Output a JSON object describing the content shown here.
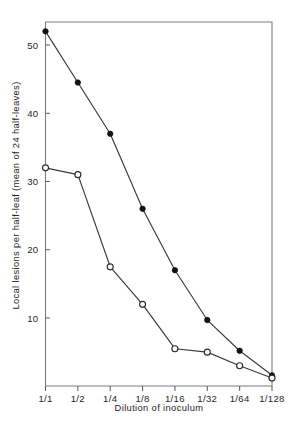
{
  "chart_data": {
    "type": "line",
    "title": "",
    "xlabel": "Dilution of inoculum",
    "ylabel": "Local lesions per half-leaf (mean of 24 half-leaves)",
    "categories": [
      "1/1",
      "1/2",
      "1/4",
      "1/8",
      "1/16",
      "1/32",
      "1/64",
      "1/128"
    ],
    "x_tick_labels": [
      "1/1",
      "1/2",
      "1/4",
      "1/8",
      "1/16",
      "1/32",
      "1/64",
      "1/128"
    ],
    "y_tick_labels": [
      "10",
      "20",
      "30",
      "40",
      "50"
    ],
    "y_ticks": [
      10,
      20,
      30,
      40,
      50
    ],
    "ylim": [
      0,
      55
    ],
    "grid": false,
    "legend_position": "none",
    "series": [
      {
        "name": "filled-circle-series",
        "marker": "filled-circle",
        "color": "#111111",
        "values": [
          52,
          44.5,
          37,
          26,
          17,
          9.7,
          5.2,
          1.6
        ]
      },
      {
        "name": "open-circle-series",
        "marker": "open-circle",
        "color": "#2b2b2b",
        "values": [
          32,
          31,
          17.5,
          12,
          5.5,
          5,
          3,
          1.2
        ]
      }
    ]
  },
  "axes": {
    "x_title": "Dilution of inoculum",
    "y_title": "Local lesions per half-leaf (mean of 24 half-leaves)"
  },
  "colors": {
    "frame": "#7d7d7d",
    "line": "#3a3a3a",
    "filled_marker": "#111111",
    "open_marker_stroke": "#2b2b2b",
    "open_marker_fill": "#ffffff",
    "text": "#262626",
    "background": "#ffffff"
  }
}
